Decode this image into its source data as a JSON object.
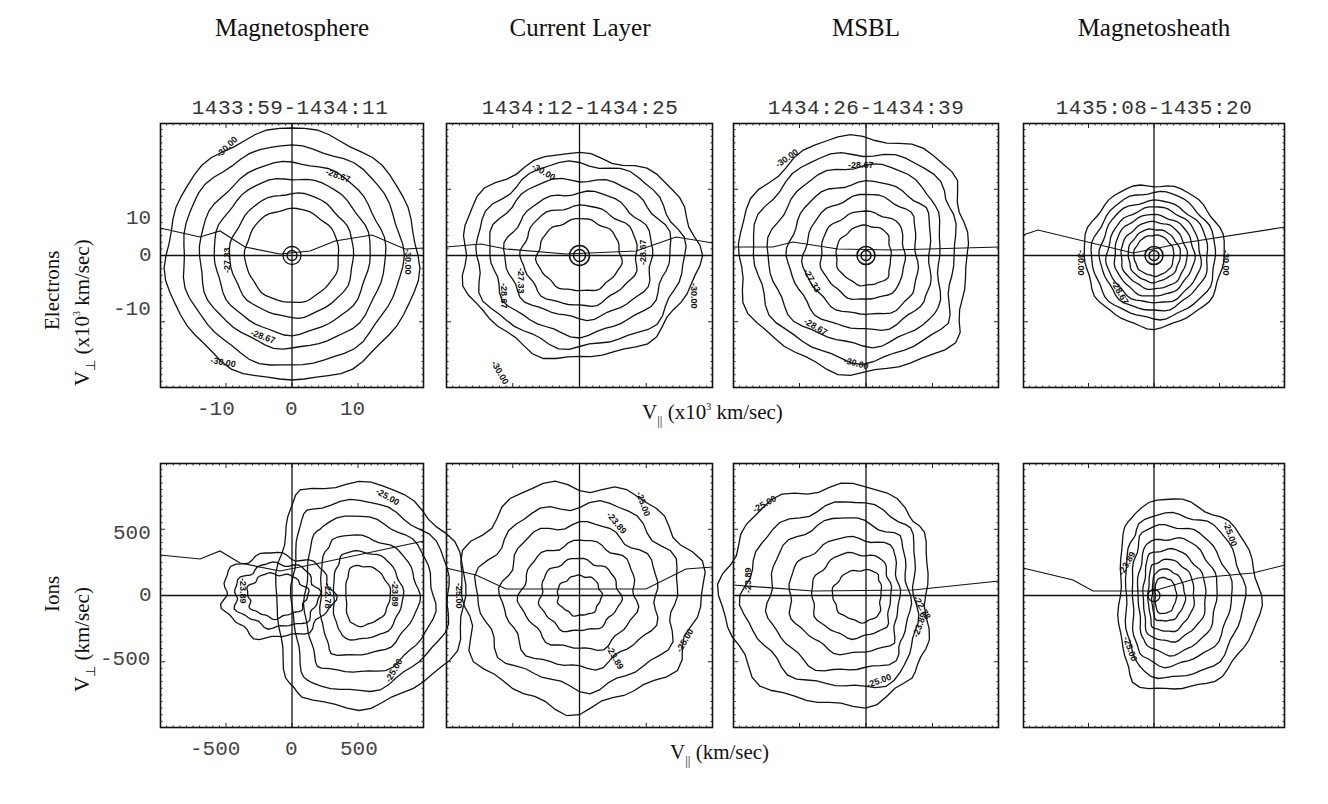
{
  "columns": [
    {
      "title": "Magnetosphere",
      "time": "1433:59-1434:11"
    },
    {
      "title": "Current Layer",
      "time": "1434:12-1434:25"
    },
    {
      "title": "MSBL",
      "time": "1434:26-1434:39"
    },
    {
      "title": "Magnetosheath",
      "time": "1435:08-1435:20"
    }
  ],
  "rows": {
    "electrons": {
      "species": "Electrons",
      "ylabel_v": "V",
      "ylabel_sub": "⊥",
      "ylabel_pre": " (x10",
      "ylabel_sup": "3",
      "ylabel_post": " km/sec)",
      "xlabel_v": "V",
      "xlabel_sub": "||",
      "xlabel_pre": " (x10",
      "xlabel_sup": "3",
      "xlabel_post": " km/sec)",
      "yticks": [
        "10",
        "0",
        "-10"
      ],
      "xticks": [
        "-10",
        "0",
        "10"
      ]
    },
    "ions": {
      "species": "Ions",
      "ylabel_v": "V",
      "ylabel_sub": "⊥",
      "ylabel_post": " (km/sec)",
      "xlabel_v": "V",
      "xlabel_sub": "||",
      "xlabel_post": " (km/sec)",
      "yticks": [
        "500",
        "0",
        "-500"
      ],
      "xticks": [
        "-500",
        "0",
        "500"
      ]
    }
  },
  "chart_data": [
    {
      "type": "contour",
      "species": "Electrons",
      "region": "Magnetosphere",
      "time": "1433:59-1434:11",
      "xlabel": "V|| (x10^3 km/sec)",
      "ylabel": "V⊥ (x10^3 km/sec)",
      "xlim": [
        -20,
        20
      ],
      "ylim": [
        -20,
        20
      ],
      "contour_labels": [
        "-30.00",
        "-28.67",
        "-27.33",
        "-28.67",
        "-30.00",
        "-30.00"
      ],
      "shape": "concentric near-circular, radius to ~19"
    },
    {
      "type": "contour",
      "species": "Electrons",
      "region": "Current Layer",
      "time": "1434:12-1434:25",
      "xlim": [
        -20,
        20
      ],
      "ylim": [
        -20,
        20
      ],
      "contour_labels": [
        "-30.00",
        "-27.33",
        "-28.67",
        "-28.67",
        "-30.00",
        "-30.00"
      ],
      "shape": "lobed, flattened, radius ~17"
    },
    {
      "type": "contour",
      "species": "Electrons",
      "region": "MSBL",
      "time": "1434:26-1434:39",
      "xlim": [
        -20,
        20
      ],
      "ylim": [
        -20,
        20
      ],
      "contour_labels": [
        "-30.00",
        "-28.67",
        "-27.33",
        "-28.67",
        "-30.00"
      ],
      "shape": "D-shaped, truncated at +V||"
    },
    {
      "type": "contour",
      "species": "Electrons",
      "region": "Magnetosheath",
      "time": "1435:08-1435:20",
      "xlim": [
        -20,
        20
      ],
      "ylim": [
        -20,
        20
      ],
      "contour_labels": [
        "-30.00",
        "-28.67",
        "-30.00"
      ],
      "shape": "compact concentric, radius ~11"
    },
    {
      "type": "contour",
      "species": "Ions",
      "region": "Magnetosphere",
      "time": "1433:59-1434:11",
      "xlabel": "V|| (km/sec)",
      "ylabel": "V⊥ (km/sec)",
      "xlim": [
        -1000,
        1000
      ],
      "ylim": [
        -1000,
        1000
      ],
      "contour_labels": [
        "-25.00",
        "-23.89",
        "-22.78",
        "-23.89",
        "-25.00"
      ],
      "shape": "crescent shifted to +V||, peak near 400"
    },
    {
      "type": "contour",
      "species": "Ions",
      "region": "Current Layer",
      "time": "1434:12-1434:25",
      "xlim": [
        -1000,
        1000
      ],
      "ylim": [
        -1000,
        1000
      ],
      "contour_labels": [
        "-25.00",
        "-23.89",
        "-25.00",
        "-23.89",
        "-25.00"
      ],
      "shape": "broad, symmetric, noisy"
    },
    {
      "type": "contour",
      "species": "Ions",
      "region": "MSBL",
      "time": "1434:26-1434:39",
      "xlim": [
        -1000,
        1000
      ],
      "ylim": [
        -1000,
        1000
      ],
      "contour_labels": [
        "-25.00",
        "-23.89",
        "-22.78",
        "-23.89",
        "-25.00"
      ],
      "shape": "shifted to -V||"
    },
    {
      "type": "contour",
      "species": "Ions",
      "region": "Magnetosheath",
      "time": "1435:08-1435:20",
      "xlim": [
        -1000,
        1000
      ],
      "ylim": [
        -1000,
        1000
      ],
      "contour_labels": [
        "-25.00",
        "-23.89",
        "-25.00"
      ],
      "shape": "compact, shifted slightly to +V||"
    }
  ]
}
